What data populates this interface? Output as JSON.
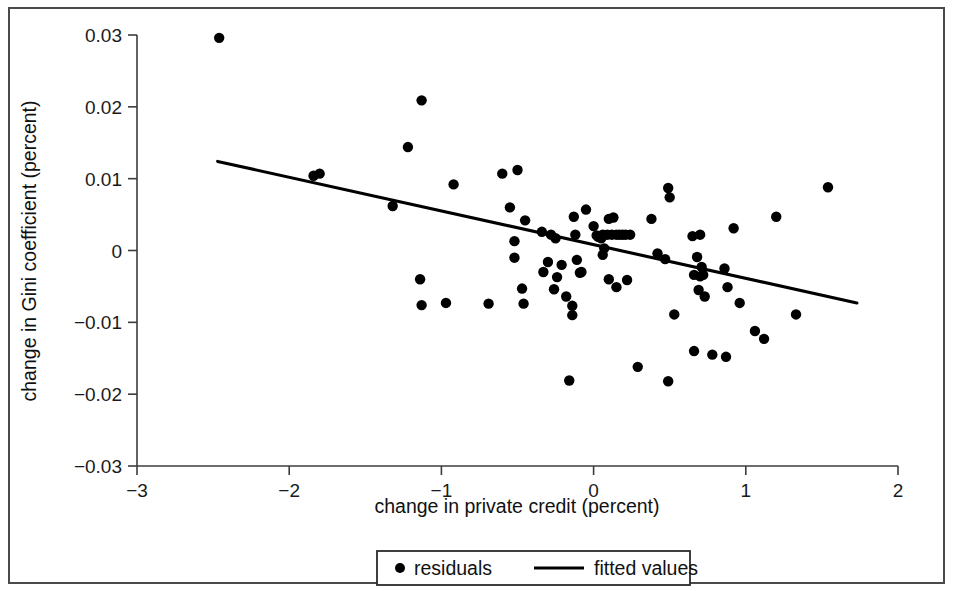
{
  "chart_data": {
    "type": "scatter",
    "title": "",
    "xlabel": "change in private credit (percent)",
    "ylabel": "change in Gini coefficient (percent)",
    "xlim": [
      -3,
      2
    ],
    "ylim": [
      -0.03,
      0.03
    ],
    "xticks": [
      -3,
      -2,
      -1,
      0,
      1,
      2
    ],
    "xtick_labels": [
      "−3",
      "−2",
      "−1",
      "0",
      "1",
      "2"
    ],
    "yticks": [
      0.03,
      0.02,
      0.01,
      0,
      -0.01,
      -0.02,
      -0.03
    ],
    "ytick_labels": [
      "0.03",
      "0.02",
      "0.01",
      "0",
      "−0.01",
      "−0.02",
      "−0.03"
    ],
    "grid": false,
    "legend_position": "bottom-center",
    "legend": [
      {
        "label": "residuals",
        "marker": "dot",
        "color": "#000000"
      },
      {
        "label": "fitted values",
        "marker": "line",
        "color": "#000000"
      }
    ],
    "series": [
      {
        "name": "residuals",
        "type": "scatter",
        "marker": "filled-circle",
        "color": "#000000",
        "points": [
          [
            -2.46,
            0.0296
          ],
          [
            -1.84,
            0.0104
          ],
          [
            -1.8,
            0.0107
          ],
          [
            -1.13,
            0.0209
          ],
          [
            -1.22,
            0.0144
          ],
          [
            -1.32,
            0.0062
          ],
          [
            -0.92,
            0.0092
          ],
          [
            -1.14,
            -0.004
          ],
          [
            -1.13,
            -0.0076
          ],
          [
            -0.97,
            -0.0073
          ],
          [
            -0.69,
            -0.0074
          ],
          [
            -0.6,
            0.0107
          ],
          [
            -0.5,
            0.0112
          ],
          [
            -0.55,
            0.006
          ],
          [
            -0.45,
            0.0042
          ],
          [
            -0.52,
            -0.001
          ],
          [
            -0.52,
            0.0013
          ],
          [
            -0.47,
            -0.0053
          ],
          [
            -0.46,
            -0.0074
          ],
          [
            -0.34,
            0.0026
          ],
          [
            -0.28,
            0.0022
          ],
          [
            -0.25,
            0.0017
          ],
          [
            -0.3,
            -0.0016
          ],
          [
            -0.33,
            -0.003
          ],
          [
            -0.24,
            -0.0037
          ],
          [
            -0.21,
            -0.002
          ],
          [
            -0.26,
            -0.0054
          ],
          [
            -0.18,
            -0.0064
          ],
          [
            -0.16,
            -0.0181
          ],
          [
            -0.13,
            0.0047
          ],
          [
            -0.12,
            0.0022
          ],
          [
            -0.11,
            -0.0013
          ],
          [
            -0.09,
            -0.0031
          ],
          [
            -0.08,
            -0.003
          ],
          [
            -0.14,
            -0.0077
          ],
          [
            -0.14,
            -0.009
          ],
          [
            -0.05,
            0.0057
          ],
          [
            0.0,
            0.0034
          ],
          [
            0.02,
            0.0021
          ],
          [
            0.03,
            0.0019
          ],
          [
            0.05,
            0.0017
          ],
          [
            0.06,
            0.0022
          ],
          [
            0.09,
            0.0022
          ],
          [
            0.12,
            0.0022
          ],
          [
            0.15,
            0.0022
          ],
          [
            0.17,
            0.0022
          ],
          [
            0.19,
            0.0022
          ],
          [
            0.21,
            0.0022
          ],
          [
            0.24,
            0.0022
          ],
          [
            0.1,
            0.0044
          ],
          [
            0.13,
            0.0046
          ],
          [
            0.07,
            0.0003
          ],
          [
            0.06,
            -0.0006
          ],
          [
            0.1,
            -0.004
          ],
          [
            0.15,
            -0.0051
          ],
          [
            0.22,
            -0.0041
          ],
          [
            0.29,
            -0.0162
          ],
          [
            0.38,
            0.0044
          ],
          [
            0.42,
            -0.0004
          ],
          [
            0.47,
            -0.0012
          ],
          [
            0.5,
            0.0074
          ],
          [
            0.49,
            0.0087
          ],
          [
            0.53,
            -0.0089
          ],
          [
            0.49,
            -0.0182
          ],
          [
            0.65,
            0.002
          ],
          [
            0.7,
            0.0022
          ],
          [
            0.68,
            -0.0009
          ],
          [
            0.71,
            -0.0023
          ],
          [
            0.66,
            -0.0034
          ],
          [
            0.72,
            -0.0034
          ],
          [
            0.7,
            -0.0036
          ],
          [
            0.69,
            -0.0055
          ],
          [
            0.73,
            -0.0064
          ],
          [
            0.66,
            -0.014
          ],
          [
            0.78,
            -0.0145
          ],
          [
            0.87,
            -0.0148
          ],
          [
            0.92,
            0.0031
          ],
          [
            0.86,
            -0.0025
          ],
          [
            0.88,
            -0.0051
          ],
          [
            0.96,
            -0.0073
          ],
          [
            1.06,
            -0.0112
          ],
          [
            1.12,
            -0.0123
          ],
          [
            1.2,
            0.0047
          ],
          [
            1.33,
            -0.0089
          ],
          [
            1.54,
            0.0088
          ]
        ]
      },
      {
        "name": "fitted values",
        "type": "line",
        "color": "#000000",
        "endpoints": [
          [
            -2.47,
            0.0124
          ],
          [
            1.73,
            -0.0073
          ]
        ]
      }
    ]
  }
}
